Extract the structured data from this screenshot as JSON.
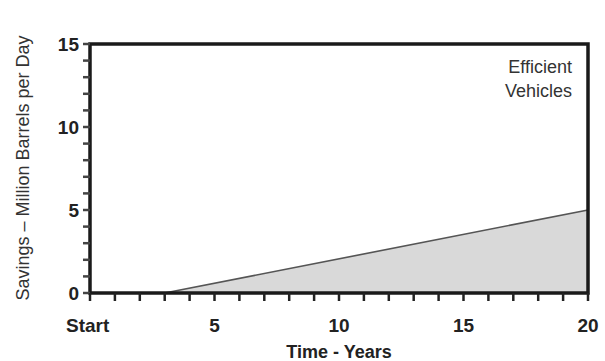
{
  "chart_data": {
    "type": "area",
    "title": "",
    "xlabel": "Time - Years",
    "ylabel": "Savings – Million Barrels per Day",
    "x_tick_labels": [
      "Start",
      "5",
      "10",
      "15",
      "20"
    ],
    "x_tick_values": [
      0,
      5,
      10,
      15,
      20
    ],
    "y_tick_labels": [
      "0",
      "5",
      "10",
      "15"
    ],
    "y_tick_values": [
      0,
      5,
      10,
      15
    ],
    "xlim": [
      0,
      20
    ],
    "ylim": [
      0,
      15
    ],
    "x_minor_step": 1,
    "y_minor_step": 1,
    "grid": false,
    "series": [
      {
        "name": "Efficient Vehicles",
        "x": [
          0,
          3,
          20
        ],
        "values": [
          0,
          0,
          5
        ],
        "fill_color": "#d9d9d9",
        "line_color": "#555555"
      }
    ],
    "annotations": [
      {
        "text_lines": [
          "Efficient",
          "Vehicles"
        ],
        "position": "top-right"
      }
    ]
  },
  "colors": {
    "axis": "#1a1a1a",
    "fill": "#d9d9d9",
    "line": "#555555",
    "text": "#222222"
  }
}
